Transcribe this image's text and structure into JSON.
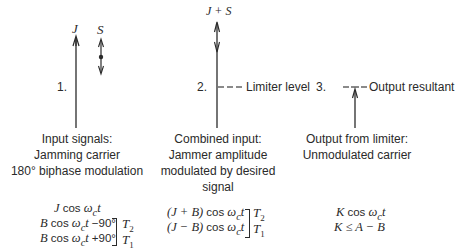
{
  "panels": [
    {
      "number": "1.",
      "vectors": [
        {
          "label": "J",
          "type": "single-arrow-up"
        },
        {
          "label": "S",
          "type": "double-arrow-with-dot"
        }
      ],
      "caption": [
        "Input signals:",
        "Jamming carrier",
        "180° biphase modulation"
      ],
      "formulas": {
        "line1": "J cos ω_c t",
        "line2": "B cos ω_c t −90°",
        "line3": "B cos ω_c t +90°",
        "bracket_labels": [
          "T2",
          "T1"
        ]
      }
    },
    {
      "number": "2.",
      "vectors": [
        {
          "label": "J + S",
          "type": "arrow-up-with-modulation"
        }
      ],
      "level_label": "Limiter level",
      "caption": [
        "Combined input:",
        "Jammer amplitude",
        "modulated by desired",
        "signal"
      ],
      "formulas": {
        "line1": "(J + B) cos ω_c t",
        "line2": "(J − B) cos ω_c t",
        "bracket_labels": [
          "T2",
          "T1"
        ]
      }
    },
    {
      "number": "3.",
      "vectors": [
        {
          "label": "",
          "type": "short-arrow-up"
        }
      ],
      "level_label": "Output resultant",
      "caption": [
        "Output from limiter:",
        "Unmodulated carrier"
      ],
      "formulas": {
        "line1": "K cos ω_c t",
        "line2": "K ≤ A − B"
      }
    }
  ],
  "text": {
    "p1_num": "1.",
    "p1_J": "J",
    "p1_S": "S",
    "p1_cap1": "Input signals:",
    "p1_cap2": "Jamming carrier",
    "p1_cap3": "180° biphase modulation",
    "p1_f1_var": "J",
    "p1_f2_var": "B",
    "p1_f2_phase": "−90°",
    "p1_f3_var": "B",
    "p1_f3_phase": "+90°",
    "p2_num": "2.",
    "p2_JS": "J + S",
    "p2_level": "Limiter level",
    "p2_cap1": "Combined input:",
    "p2_cap2": "Jammer amplitude",
    "p2_cap3": "modulated by desired",
    "p2_cap4": "signal",
    "p2_f1_pre": "(J + B)",
    "p2_f2_pre": "(J − B)",
    "p3_num": "3.",
    "p3_level": "Output resultant",
    "p3_cap1": "Output from limiter:",
    "p3_cap2": "Unmodulated carrier",
    "p3_f1_var": "K",
    "p3_f2": "K ≤ A − B",
    "cos": "cos",
    "omega": "ω",
    "c": "c",
    "t": "t",
    "T": "T",
    "sub2": "2",
    "sub1": "1"
  },
  "colors": {
    "ink": "#2a2a2a",
    "background": "#ffffff"
  }
}
